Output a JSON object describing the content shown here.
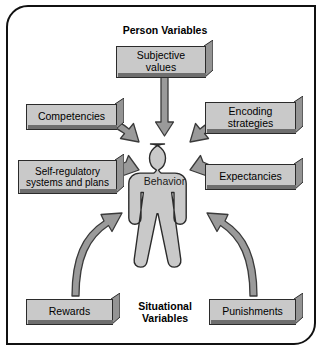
{
  "diagram": {
    "title_person": "Person Variables",
    "title_situational_line1": "Situational",
    "title_situational_line2": "Variables",
    "center_label": "Behavior",
    "colors": {
      "box_face": "#c9c9c9",
      "box_top": "#b0b0b0",
      "box_side": "#8f8f8f",
      "box_shadow": "#6e6e6e",
      "figure_fill": "#c9c9c9",
      "arrow_fill": "#9a9a9a",
      "arrow_stroke": "#3a3a3a",
      "outline": "#111111",
      "background": "#ffffff"
    },
    "person_variables": [
      {
        "id": "subjective-values",
        "label_line1": "Subjective",
        "label_line2": "values"
      },
      {
        "id": "competencies",
        "label_line1": "Competencies",
        "label_line2": ""
      },
      {
        "id": "encoding-strategies",
        "label_line1": "Encoding",
        "label_line2": "strategies"
      },
      {
        "id": "self-regulatory",
        "label_line1": "Self-regulatory",
        "label_line2": "systems and plans"
      },
      {
        "id": "expectancies",
        "label_line1": "Expectancies",
        "label_line2": ""
      }
    ],
    "situational_variables": [
      {
        "id": "rewards",
        "label_line1": "Rewards",
        "label_line2": ""
      },
      {
        "id": "punishments",
        "label_line1": "Punishments",
        "label_line2": ""
      }
    ],
    "arrows": [
      {
        "from": "subjective-values",
        "to": "behavior",
        "style": "straight-down"
      },
      {
        "from": "competencies",
        "to": "behavior",
        "style": "curved"
      },
      {
        "from": "encoding-strategies",
        "to": "behavior",
        "style": "curved"
      },
      {
        "from": "self-regulatory",
        "to": "behavior",
        "style": "curved"
      },
      {
        "from": "expectancies",
        "to": "behavior",
        "style": "curved"
      },
      {
        "from": "rewards",
        "to": "behavior",
        "style": "curved-long"
      },
      {
        "from": "punishments",
        "to": "behavior",
        "style": "curved-long"
      }
    ]
  }
}
